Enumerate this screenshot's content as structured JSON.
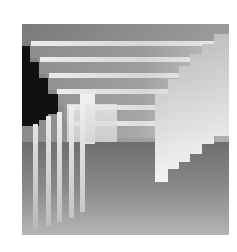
{
  "figure": {
    "colors": {
      "dark": "#111111",
      "light": "#f2f2f2",
      "mid": "#8e8e8e",
      "pale": "#c4c4c4"
    }
  }
}
